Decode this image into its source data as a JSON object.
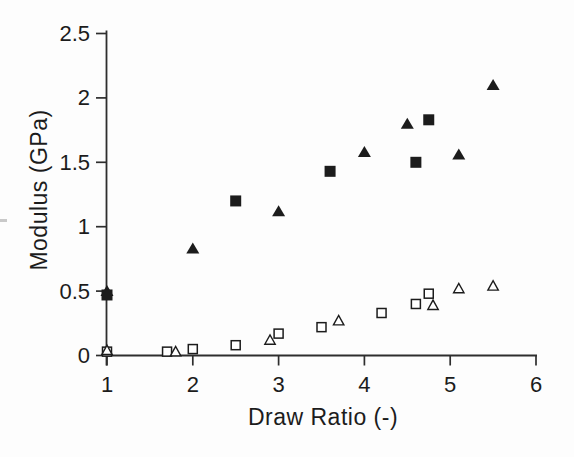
{
  "figure": {
    "background": "#fdfdfd",
    "ink_color": "#1c1c1c",
    "axis_color": "#2e2e2e"
  },
  "chart_data": {
    "type": "scatter",
    "title": "",
    "xlabel": "Draw Ratio (-)",
    "ylabel": "Modulus (GPa)",
    "xlim": [
      1,
      6
    ],
    "ylim": [
      0,
      2.5
    ],
    "xticks": [
      1,
      2,
      3,
      4,
      5,
      6
    ],
    "yticks": [
      0,
      0.5,
      1,
      1.5,
      2,
      2.5
    ],
    "grid": false,
    "legend_position": "none",
    "series": [
      {
        "name": "filled-square-series",
        "marker": "square-filled",
        "points": [
          [
            1,
            0.47
          ],
          [
            2.5,
            1.2
          ],
          [
            3.6,
            1.43
          ],
          [
            4.6,
            1.5
          ],
          [
            4.75,
            1.83
          ]
        ]
      },
      {
        "name": "filled-triangle-series",
        "marker": "triangle-filled",
        "points": [
          [
            1,
            0.5
          ],
          [
            2,
            0.83
          ],
          [
            3,
            1.12
          ],
          [
            4,
            1.58
          ],
          [
            4.5,
            1.8
          ],
          [
            5.1,
            1.56
          ],
          [
            5.5,
            2.1
          ]
        ]
      },
      {
        "name": "open-square-series",
        "marker": "square-open",
        "points": [
          [
            1,
            0.03
          ],
          [
            1.7,
            0.03
          ],
          [
            2,
            0.05
          ],
          [
            2.5,
            0.08
          ],
          [
            3,
            0.17
          ],
          [
            3.5,
            0.22
          ],
          [
            4.2,
            0.33
          ],
          [
            4.6,
            0.4
          ],
          [
            4.75,
            0.48
          ]
        ]
      },
      {
        "name": "open-triangle-series",
        "marker": "triangle-open",
        "points": [
          [
            1,
            0.04
          ],
          [
            1.8,
            0.03
          ],
          [
            2.9,
            0.12
          ],
          [
            3.7,
            0.27
          ],
          [
            4.8,
            0.39
          ],
          [
            5.1,
            0.52
          ],
          [
            5.5,
            0.54
          ]
        ]
      }
    ]
  }
}
